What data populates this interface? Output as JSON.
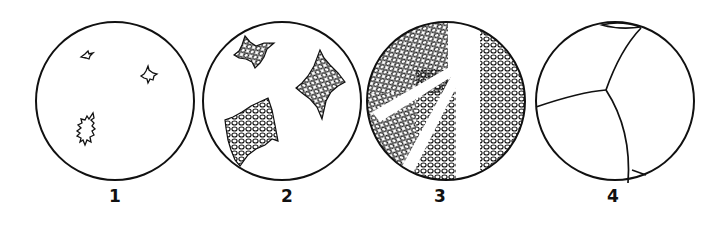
{
  "figure": {
    "panels": [
      {
        "label": "1",
        "stage": "few small dendritic nuclei"
      },
      {
        "label": "2",
        "stage": "growing dendritic crystals"
      },
      {
        "label": "3",
        "stage": "dendrites filling field"
      },
      {
        "label": "4",
        "stage": "grain boundaries of solidified grains"
      }
    ]
  },
  "colors": {
    "ink": "#111111",
    "background": "#ffffff"
  }
}
